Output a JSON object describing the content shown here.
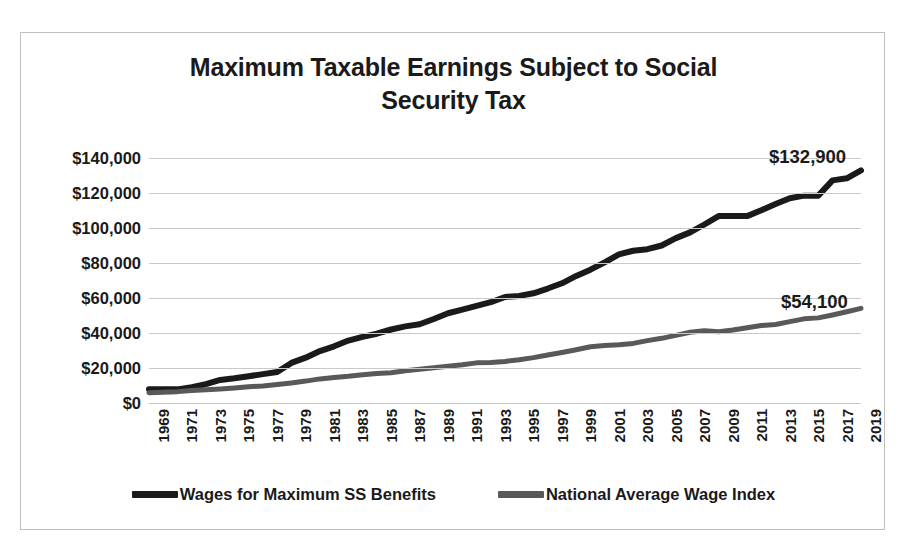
{
  "chart_data": {
    "type": "line",
    "title": "Maximum Taxable Earnings Subject to Social Security Tax",
    "title_line1": "Maximum Taxable Earnings Subject to Social",
    "title_line2": "Security Tax",
    "xlabel": "",
    "ylabel": "",
    "grid": true,
    "legend_position": "bottom",
    "ylim": [
      0,
      140000
    ],
    "ytick_labels": [
      "$140,000",
      "$120,000",
      "$100,000",
      "$80,000",
      "$60,000",
      "$40,000",
      "$20,000",
      "$0"
    ],
    "ytick_values": [
      140000,
      120000,
      100000,
      80000,
      60000,
      40000,
      20000,
      0
    ],
    "xlim": [
      1969,
      2019
    ],
    "xtick_labels": [
      "1969",
      "1971",
      "1973",
      "1975",
      "1977",
      "1979",
      "1981",
      "1983",
      "1985",
      "1987",
      "1989",
      "1991",
      "1993",
      "1995",
      "1997",
      "1999",
      "2001",
      "2003",
      "2005",
      "2007",
      "2009",
      "2011",
      "2013",
      "2015",
      "2017",
      "2019"
    ],
    "x": [
      1969,
      1970,
      1971,
      1972,
      1973,
      1974,
      1975,
      1976,
      1977,
      1978,
      1979,
      1980,
      1981,
      1982,
      1983,
      1984,
      1985,
      1986,
      1987,
      1988,
      1989,
      1990,
      1991,
      1992,
      1993,
      1994,
      1995,
      1996,
      1997,
      1998,
      1999,
      2000,
      2001,
      2002,
      2003,
      2004,
      2005,
      2006,
      2007,
      2008,
      2009,
      2010,
      2011,
      2012,
      2013,
      2014,
      2015,
      2016,
      2017,
      2018,
      2019
    ],
    "series": [
      {
        "name": "Wages for Maximum SS Benefits",
        "color": "#1a1a1a",
        "values": [
          7800,
          7800,
          7800,
          9000,
          10800,
          13200,
          14100,
          15300,
          16500,
          17700,
          22900,
          25900,
          29700,
          32400,
          35700,
          37800,
          39600,
          42000,
          43800,
          45000,
          48000,
          51300,
          53400,
          55500,
          57600,
          60600,
          61200,
          62700,
          65400,
          68400,
          72600,
          76200,
          80400,
          84900,
          87000,
          87900,
          90000,
          94200,
          97500,
          102000,
          106800,
          106800,
          106800,
          110100,
          113700,
          117000,
          118500,
          118500,
          127200,
          128400,
          132900
        ]
      },
      {
        "name": "National Average Wage Index",
        "color": "#595959",
        "values": [
          5893,
          6186,
          6497,
          7134,
          7580,
          8031,
          8631,
          9226,
          9779,
          10556,
          11479,
          12513,
          13773,
          14531,
          15239,
          16135,
          16823,
          17322,
          18427,
          19334,
          20100,
          21028,
          21812,
          22935,
          23133,
          23754,
          24706,
          25914,
          27426,
          28861,
          30470,
          32155,
          32922,
          33252,
          34065,
          35649,
          36953,
          38651,
          40405,
          41335,
          40712,
          41674,
          42980,
          44321,
          44888,
          46482,
          48099,
          48642,
          50322,
          52146,
          54100
        ]
      }
    ],
    "annotations": [
      {
        "text": "$132,900",
        "series": "Wages for Maximum SS Benefits",
        "x": 2019,
        "y": 132900
      },
      {
        "text": "$54,100",
        "series": "National Average Wage Index",
        "x": 2019,
        "y": 54100
      }
    ]
  },
  "legend": {
    "items": [
      {
        "label": "Wages for Maximum SS Benefits",
        "color": "#1a1a1a"
      },
      {
        "label": "National Average Wage Index",
        "color": "#595959"
      }
    ]
  },
  "colors": {
    "series_primary": "#1a1a1a",
    "series_secondary": "#595959",
    "gridline": "#c9c9c9",
    "border": "#bfbfbf",
    "text": "#1a1a1a",
    "background": "#ffffff"
  }
}
